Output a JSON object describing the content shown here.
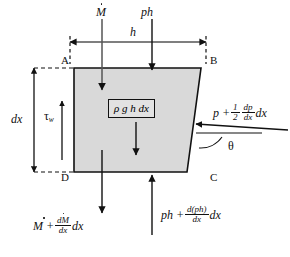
{
  "figure": {
    "type": "free-body-diagram",
    "body_fill": "#d9d9d9",
    "line_color": "#111111"
  },
  "corners": {
    "top_left": "A",
    "top_right": "B",
    "bottom_right": "C",
    "bottom_left": "D"
  },
  "labels": {
    "momentum_in": {
      "base": "M",
      "accent": "dot"
    },
    "pressure_top": "ph",
    "width": "h",
    "height": "dx",
    "wall_shear": {
      "symbol": "τ",
      "subscript": "w"
    },
    "weight": "ρ g h dx",
    "angle": "θ",
    "pressure_side": {
      "lead": "p +",
      "frac_num": "1",
      "frac_den": "2",
      "frac2_num": "dp",
      "frac2_den": "dx",
      "tail": "dx"
    },
    "momentum_out": {
      "lead": "M +",
      "frac_num": "dM",
      "frac_den": "dx",
      "tail": "dx"
    },
    "pressure_bottom": {
      "lead": "ph +",
      "frac_num": "d(ph)",
      "frac_den": "dx",
      "tail": "dx"
    }
  },
  "geometry": {
    "trapezoid_points": "74,68 201,68 187,172 74,172",
    "dim_width_y": 42,
    "dim_height_x": 34
  }
}
